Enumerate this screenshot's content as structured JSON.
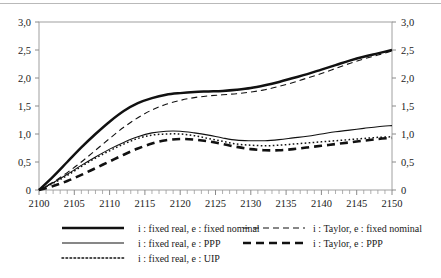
{
  "figure": {
    "name": "interest-rate-exchange-rate-simulation-chart",
    "has_top_rule": true
  },
  "chart_data": {
    "type": "line",
    "title": "",
    "subtitle": "",
    "xlabel": "",
    "ylabel": "",
    "y2label": "",
    "xlim": [
      2100,
      2150
    ],
    "ylim": [
      0,
      3.0
    ],
    "grid": false,
    "legend_position": "bottom",
    "decimal_separator": ",",
    "x_ticks_major": [
      2100,
      2105,
      2110,
      2115,
      2120,
      2125,
      2130,
      2135,
      2140,
      2145,
      2150
    ],
    "x_tick_labels": [
      "2100",
      "2105",
      "2110",
      "2115",
      "2120",
      "2125",
      "2130",
      "2135",
      "2140",
      "2145",
      "2150"
    ],
    "x_minor_tick_step": 1,
    "y_ticks": [
      0,
      0.5,
      1.0,
      1.5,
      2.0,
      2.5,
      3.0
    ],
    "y_tick_labels_left": [
      "0",
      "0,5",
      "1,0",
      "1,5",
      "2,0",
      "2,5",
      "3,0"
    ],
    "y_tick_labels_right": [
      "0",
      "0,5",
      "1,0",
      "1,5",
      "2,0",
      "2,5",
      "3,0"
    ],
    "x": [
      2100,
      2102,
      2104,
      2106,
      2108,
      2110,
      2112,
      2114,
      2116,
      2118,
      2120,
      2122,
      2124,
      2126,
      2128,
      2130,
      2132,
      2134,
      2136,
      2138,
      2140,
      2142,
      2144,
      2146,
      2148,
      2150
    ],
    "series": [
      {
        "name": "i : fixed real, e : fixed nominal",
        "style": "solid",
        "width": "thick",
        "color": "#111111",
        "values": [
          0.0,
          0.24,
          0.5,
          0.76,
          1.0,
          1.22,
          1.41,
          1.55,
          1.64,
          1.7,
          1.73,
          1.75,
          1.76,
          1.77,
          1.79,
          1.82,
          1.87,
          1.93,
          2.0,
          2.07,
          2.15,
          2.23,
          2.31,
          2.38,
          2.44,
          2.5
        ]
      },
      {
        "name": "i : Taylor, e : fixed nominal",
        "style": "dashed",
        "width": "thin",
        "color": "#111111",
        "values": [
          0.0,
          0.14,
          0.31,
          0.5,
          0.71,
          0.92,
          1.12,
          1.29,
          1.43,
          1.53,
          1.6,
          1.65,
          1.68,
          1.7,
          1.72,
          1.75,
          1.79,
          1.85,
          1.92,
          2.0,
          2.08,
          2.17,
          2.26,
          2.34,
          2.41,
          2.48
        ]
      },
      {
        "name": "i : fixed real, e : PPP",
        "style": "solid",
        "width": "thin",
        "color": "#111111",
        "values": [
          0.0,
          0.13,
          0.28,
          0.44,
          0.59,
          0.73,
          0.85,
          0.95,
          1.02,
          1.05,
          1.05,
          1.02,
          0.98,
          0.93,
          0.89,
          0.88,
          0.88,
          0.9,
          0.93,
          0.96,
          1.0,
          1.04,
          1.07,
          1.1,
          1.13,
          1.15
        ]
      },
      {
        "name": "i : fixed real, e : UIP",
        "style": "dotted",
        "width": "thin",
        "color": "#111111",
        "values": [
          0.0,
          0.12,
          0.26,
          0.42,
          0.57,
          0.7,
          0.82,
          0.92,
          0.98,
          1.0,
          1.0,
          0.97,
          0.92,
          0.87,
          0.82,
          0.8,
          0.79,
          0.8,
          0.82,
          0.84,
          0.86,
          0.88,
          0.9,
          0.92,
          0.94,
          0.95
        ]
      },
      {
        "name": "i : Taylor, e : PPP",
        "style": "dashed",
        "width": "thick",
        "color": "#111111",
        "values": [
          0.0,
          0.07,
          0.16,
          0.27,
          0.39,
          0.51,
          0.63,
          0.74,
          0.83,
          0.89,
          0.91,
          0.9,
          0.87,
          0.82,
          0.77,
          0.73,
          0.71,
          0.71,
          0.73,
          0.76,
          0.79,
          0.82,
          0.85,
          0.88,
          0.91,
          0.93
        ]
      }
    ]
  },
  "legend": {
    "column_left": [
      {
        "label": "i : fixed real, e : fixed nominal",
        "style": "solid",
        "width": "thick"
      },
      {
        "label": "i : fixed real, e : PPP",
        "style": "solid",
        "width": "thin"
      },
      {
        "label": "i : fixed real, e : UIP",
        "style": "dotted",
        "width": "thin"
      }
    ],
    "column_right": [
      {
        "label": "i : Taylor, e : fixed nominal",
        "style": "dashed",
        "width": "thin"
      },
      {
        "label": "i : Taylor, e : PPP",
        "style": "dashed",
        "width": "thick"
      }
    ]
  }
}
